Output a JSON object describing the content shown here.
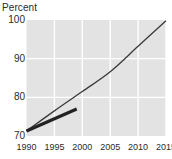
{
  "chart_data": {
    "type": "line",
    "title": "",
    "xlabel": "",
    "ylabel": "Percent",
    "xlim": [
      1990,
      2015
    ],
    "ylim": [
      70,
      100
    ],
    "grid": true,
    "legend": "none",
    "y_ticks": [
      "100",
      "90",
      "80",
      "70"
    ],
    "y_tick_values": [
      100,
      90,
      80,
      70
    ],
    "x_ticks": [
      "1990",
      "1995",
      "2000",
      "2005",
      "2010",
      "2015"
    ],
    "x_tick_values": [
      1990,
      1995,
      2000,
      2005,
      2010,
      2015
    ],
    "series": [
      {
        "name": "projection",
        "style": "thin-line",
        "color": "#3a3a3a",
        "width": 1.3,
        "x": [
          1990,
          1995,
          2000,
          2005,
          2010,
          2015
        ],
        "values": [
          71.3,
          76.5,
          81.5,
          86.6,
          93.2,
          99.8
        ]
      },
      {
        "name": "actual",
        "style": "thick-line",
        "color": "#222222",
        "width": 3.2,
        "x": [
          1990,
          1999
        ],
        "values": [
          71.3,
          77.0
        ]
      }
    ]
  },
  "colors": {
    "plot_background": "#e3e3e3",
    "gridline": "#ffffff",
    "text": "#2b2b2b",
    "page_background": "#ffffff"
  },
  "axis": {
    "y_label": "Percent"
  }
}
